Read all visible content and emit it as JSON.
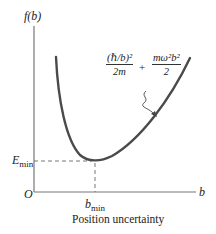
{
  "diagram": {
    "y_axis_label": "f(b)",
    "x_axis_label": "b",
    "origin_label": "O",
    "e_min_label": "E",
    "e_min_sub": "min",
    "b_min_label": "b",
    "b_min_sub": "min",
    "caption": "Position uncertainty",
    "formula": {
      "term1_num": "(ℏ/b)²",
      "term1_den": "2m",
      "plus": "+",
      "term2_num": "mω²b²",
      "term2_den": "2"
    },
    "colors": {
      "axis": "#555555",
      "curve": "#4a4a4a",
      "dashed": "#555555"
    }
  }
}
